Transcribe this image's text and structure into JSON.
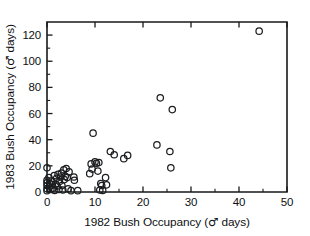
{
  "figure": {
    "background_color": "#ffffff",
    "ink_color": "#16181a"
  },
  "axes": {
    "x_title_prefix": "1982 Bush Occupancy",
    "x_title_unit_open": "(",
    "x_title_symbol": "♂",
    "x_title_unit_word": "days",
    "x_title_unit_close": ")",
    "y_title_prefix": "1983 Bush Occupancy",
    "y_title_unit_open": "(",
    "y_title_symbol": "♂",
    "y_title_unit_word": "days",
    "y_title_unit_close": ")",
    "x_ticklabels": [
      "0",
      "10",
      "20",
      "30",
      "40",
      "50"
    ],
    "y_ticklabels": [
      "0",
      "20",
      "40",
      "60",
      "80",
      "100",
      "120"
    ]
  },
  "chart_data": {
    "type": "scatter",
    "title": "",
    "subtitle": "",
    "xlabel": "1982 Bush Occupancy (♂ days)",
    "ylabel": "1983 Bush Occupancy (♂ days)",
    "xlim": [
      0,
      50
    ],
    "ylim": [
      0,
      130
    ],
    "xticks": [
      0,
      10,
      20,
      30,
      40,
      50
    ],
    "yticks": [
      0,
      20,
      40,
      60,
      80,
      100,
      120
    ],
    "x_minor_ticks": [
      5,
      15,
      25,
      35,
      45
    ],
    "y_minor_ticks": [
      10,
      30,
      50,
      70,
      90,
      110
    ],
    "grid": false,
    "legend": null,
    "marker_style": "open-circle",
    "marker_size_px": 4.2,
    "series": [
      {
        "name": "bush occupancy pairs",
        "points": [
          [
            0.0,
            18.5
          ],
          [
            0.0,
            9.0
          ],
          [
            0.0,
            7.0
          ],
          [
            0.0,
            5.0
          ],
          [
            0.0,
            2.5
          ],
          [
            0.0,
            1.0
          ],
          [
            0.4,
            11.0
          ],
          [
            0.5,
            4.0
          ],
          [
            0.6,
            6.5
          ],
          [
            0.8,
            2.0
          ],
          [
            1.0,
            8.5
          ],
          [
            1.1,
            5.5
          ],
          [
            1.3,
            3.0
          ],
          [
            1.5,
            12.5
          ],
          [
            1.6,
            1.2
          ],
          [
            1.8,
            6.0
          ],
          [
            2.0,
            10.5
          ],
          [
            2.1,
            4.5
          ],
          [
            2.3,
            13.5
          ],
          [
            2.5,
            2.0
          ],
          [
            2.6,
            8.0
          ],
          [
            2.8,
            11.5
          ],
          [
            3.0,
            14.5
          ],
          [
            3.1,
            5.0
          ],
          [
            3.3,
            1.5
          ],
          [
            3.5,
            17.0
          ],
          [
            3.6,
            9.5
          ],
          [
            3.8,
            12.0
          ],
          [
            4.0,
            18.0
          ],
          [
            4.2,
            11.0
          ],
          [
            4.4,
            2.5
          ],
          [
            4.6,
            15.5
          ],
          [
            5.0,
            1.0
          ],
          [
            5.6,
            11.5
          ],
          [
            5.7,
            9.0
          ],
          [
            6.4,
            1.0
          ],
          [
            8.9,
            14.0
          ],
          [
            9.2,
            21.5
          ],
          [
            9.4,
            17.5
          ],
          [
            9.6,
            45.0
          ],
          [
            10.0,
            23.0
          ],
          [
            10.3,
            22.0
          ],
          [
            10.6,
            16.0
          ],
          [
            10.8,
            22.5
          ],
          [
            11.0,
            1.5
          ],
          [
            11.2,
            6.5
          ],
          [
            11.4,
            5.0
          ],
          [
            11.6,
            1.2
          ],
          [
            12.2,
            11.0
          ],
          [
            12.4,
            5.5
          ],
          [
            13.2,
            31.0
          ],
          [
            14.0,
            28.5
          ],
          [
            16.0,
            25.5
          ],
          [
            16.8,
            28.0
          ],
          [
            22.9,
            36.0
          ],
          [
            23.6,
            72.0
          ],
          [
            25.6,
            31.0
          ],
          [
            25.8,
            18.5
          ],
          [
            26.1,
            63.0
          ],
          [
            44.2,
            123.0
          ]
        ]
      }
    ]
  },
  "caption": {
    "ghost_text": ""
  }
}
